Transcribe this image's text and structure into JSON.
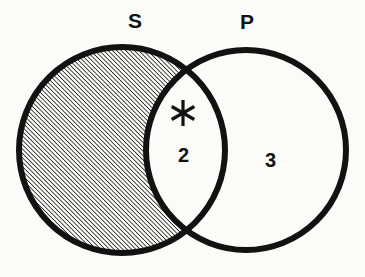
{
  "figure": {
    "type": "venn-diagram",
    "background_color": "#fbfbf9",
    "ink_color": "#121212",
    "stroke_width": 6,
    "width": 365,
    "height": 277
  },
  "sets": {
    "left": {
      "label": "S",
      "label_x": 135,
      "label_y": 12,
      "center_x": 122,
      "center_y": 150,
      "radius": 103
    },
    "right": {
      "label": "P",
      "label_x": 246,
      "label_y": 13,
      "center_x": 246,
      "center_y": 150,
      "radius": 100
    }
  },
  "regions": [
    {
      "name": "s-only",
      "label": "",
      "shading": "diagonal-hatch",
      "hatch_angle_deg": 45,
      "hatch_spacing": 3.1,
      "hatch_line_width": 1.5
    },
    {
      "name": "intersection",
      "label": "2",
      "label_x": 185,
      "label_y": 145,
      "marker": "asterisk",
      "marker_x": 183,
      "marker_y": 113,
      "shading": "none"
    },
    {
      "name": "p-only",
      "label": "3",
      "label_x": 272,
      "label_y": 150,
      "shading": "none"
    }
  ],
  "markers": {
    "asterisk": {
      "name": "asterisk-marker",
      "points": 6,
      "arm_length": 13,
      "arm_width": 3.2
    }
  }
}
